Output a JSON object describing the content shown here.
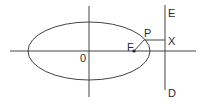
{
  "diagram": {
    "type": "ellipse-focus-directrix",
    "colors": {
      "stroke": "#444444",
      "background": "#ffffff",
      "text": "#2a2a2a"
    },
    "labels": {
      "origin": "0",
      "focus": "F",
      "point": "P",
      "foot": "X",
      "directrix_top": "E",
      "directrix_bottom": "D"
    },
    "ellipse": {
      "cx": 89,
      "cy": 51,
      "rx": 61,
      "ry": 29
    },
    "x_axis": {
      "x1": 10,
      "x2": 196,
      "y": 51
    },
    "y_axis": {
      "x": 89,
      "y1": 6,
      "y2": 97
    },
    "directrix": {
      "x": 165,
      "y1": 5,
      "y2": 90
    },
    "focus_point": {
      "x": 134,
      "y": 51
    },
    "curve_point": {
      "x": 144,
      "y": 40
    },
    "foot_point": {
      "x": 165,
      "y": 40
    }
  }
}
